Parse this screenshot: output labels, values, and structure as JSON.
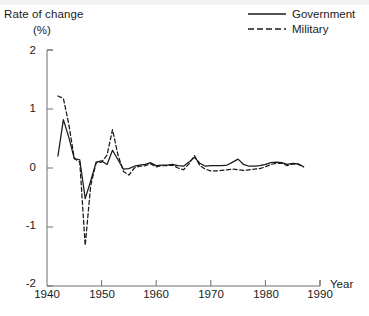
{
  "figure": {
    "background_color": "#ffffff",
    "line_color": "#1a1a1a",
    "axis_color": "#6e6e6e",
    "title": ""
  },
  "axes": {
    "y_label_line1": "Rate of change",
    "y_label_line2": "(%)",
    "x_label": "Year",
    "y_ticks": [
      "2",
      "1",
      "0",
      "-1",
      "-2"
    ],
    "x_ticks": [
      "1940",
      "1950",
      "1960",
      "1970",
      "1980",
      "1990"
    ]
  },
  "legend": {
    "position": "top-right",
    "entries": [
      {
        "label": "Government",
        "style": "solid"
      },
      {
        "label": "Military",
        "style": "dashed"
      }
    ]
  },
  "chart_data": {
    "type": "line",
    "title": "",
    "xlabel": "Year",
    "ylabel": "Rate of change (%)",
    "xlim": [
      1940,
      1990
    ],
    "ylim": [
      -2,
      2
    ],
    "xticks": [
      1940,
      1950,
      1960,
      1970,
      1980,
      1990
    ],
    "yticks": [
      -2,
      -1,
      0,
      1,
      2
    ],
    "grid": false,
    "legend_position": "top-right",
    "x": [
      1942,
      1943,
      1944,
      1945,
      1946,
      1947,
      1948,
      1949,
      1950,
      1951,
      1952,
      1953,
      1954,
      1955,
      1956,
      1957,
      1958,
      1959,
      1960,
      1961,
      1962,
      1963,
      1964,
      1965,
      1966,
      1967,
      1968,
      1969,
      1970,
      1971,
      1972,
      1973,
      1974,
      1975,
      1976,
      1977,
      1978,
      1979,
      1980,
      1981,
      1982,
      1983,
      1984,
      1985,
      1986,
      1987
    ],
    "series": [
      {
        "name": "Government",
        "style": "solid",
        "values": [
          0.2,
          0.82,
          0.52,
          0.16,
          0.14,
          -0.52,
          -0.22,
          0.1,
          0.12,
          0.06,
          0.3,
          0.14,
          -0.02,
          -0.01,
          0.03,
          0.05,
          0.06,
          0.09,
          0.04,
          0.05,
          0.05,
          0.06,
          0.04,
          0.03,
          0.1,
          0.18,
          0.08,
          0.03,
          0.04,
          0.04,
          0.04,
          0.05,
          0.1,
          0.15,
          0.06,
          0.03,
          0.03,
          0.04,
          0.06,
          0.09,
          0.1,
          0.09,
          0.06,
          0.08,
          0.07,
          0.02
        ]
      },
      {
        "name": "Military",
        "style": "dashed",
        "values": [
          1.22,
          1.18,
          0.74,
          0.16,
          0.1,
          -1.31,
          -0.3,
          0.09,
          0.1,
          0.22,
          0.65,
          0.22,
          -0.06,
          -0.12,
          0.0,
          0.03,
          0.04,
          0.07,
          0.02,
          0.04,
          0.04,
          0.05,
          0.0,
          -0.03,
          0.07,
          0.21,
          0.04,
          -0.02,
          -0.05,
          -0.05,
          -0.04,
          -0.03,
          -0.02,
          -0.03,
          -0.04,
          -0.03,
          -0.02,
          -0.01,
          0.02,
          0.06,
          0.08,
          0.08,
          0.04,
          0.07,
          0.06,
          0.02
        ]
      }
    ]
  }
}
